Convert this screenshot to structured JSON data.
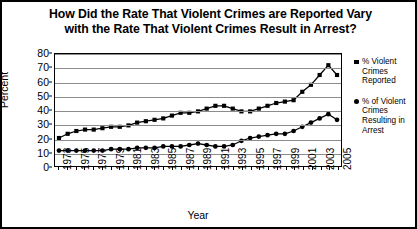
{
  "title": {
    "line1": "How Did the Rate That Violent Crimes are Reported Vary",
    "line2": "with the Rate That Violent Crimes Result in Arrest?"
  },
  "axes": {
    "ylabel": "Percent",
    "xlabel": "Year"
  },
  "legend": {
    "entries": [
      {
        "marker": "square-marker",
        "label": "% Violent Crimes Reported"
      },
      {
        "marker": "circle-marker",
        "label": "% of Violent Crimes Resulting in Arrest"
      }
    ]
  },
  "chart_data": {
    "type": "line",
    "title": "How Did the Rate That Violent Crimes are Reported Vary with the Rate That Violent Crimes Result in Arrest?",
    "xlabel": "Year",
    "ylabel": "Percent",
    "ylim": [
      0,
      80
    ],
    "ytick_labels": [
      "0",
      "10",
      "20",
      "30",
      "40",
      "50",
      "60",
      "70",
      "80"
    ],
    "yticks": [
      0,
      10,
      20,
      30,
      40,
      50,
      60,
      70,
      80
    ],
    "grid": true,
    "legend_position": "right",
    "x": [
      1973,
      1974,
      1975,
      1976,
      1977,
      1978,
      1979,
      1980,
      1981,
      1982,
      1983,
      1984,
      1985,
      1986,
      1987,
      1988,
      1989,
      1990,
      1991,
      1992,
      1993,
      1994,
      1995,
      1996,
      1997,
      1998,
      1999,
      2000,
      2001,
      2002,
      2003,
      2004,
      2005
    ],
    "xtick_labels": [
      "1973",
      "1975",
      "1977",
      "1979",
      "1981",
      "1983",
      "1985",
      "1987",
      "1989",
      "1991",
      "1993",
      "1995",
      "1997",
      "1999",
      "2001",
      "2003",
      "2005"
    ],
    "series": [
      {
        "name": "% Violent Crimes Reported",
        "marker": "square",
        "values": [
          20,
          23,
          25,
          26,
          26,
          27,
          28,
          28,
          29,
          31,
          32,
          33,
          34,
          36,
          38,
          38,
          39,
          41,
          43,
          43,
          41,
          39,
          39,
          41,
          43,
          45,
          46,
          47,
          53,
          58,
          65,
          72,
          65
        ]
      },
      {
        "name": "% of Violent Crimes Resulting in Arrest",
        "marker": "circle",
        "values": [
          11,
          11,
          11,
          11,
          11,
          11,
          12,
          12,
          12,
          13,
          13,
          13,
          14,
          14,
          14,
          15,
          16,
          15,
          14,
          14,
          15,
          18,
          20,
          21,
          22,
          23,
          23,
          25,
          28,
          31,
          34,
          37,
          33
        ]
      }
    ]
  }
}
